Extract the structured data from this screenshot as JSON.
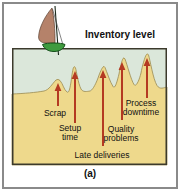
{
  "title": "Inventory level",
  "caption": "(a)",
  "problems": [
    {
      "id": "scrap",
      "label": "Scrap"
    },
    {
      "id": "setup-time",
      "label": "Setup time"
    },
    {
      "id": "late-deliveries",
      "label": "Late deliveries"
    },
    {
      "id": "quality-problems",
      "label": "Quality problems"
    },
    {
      "id": "process-downtime",
      "label": "Process downtime"
    }
  ],
  "icons": [
    {
      "name": "sailboat-icon",
      "meaning": "inventory floating on water level"
    },
    {
      "name": "up-arrow-icon",
      "meaning": "problem peak rising toward inventory surface"
    }
  ],
  "colors": {
    "background": "#ffffff",
    "water": "#dbe7da",
    "sand": "#eed98c",
    "sand_edge": "#9a8a50",
    "arrow": "#b43a22",
    "sail": "#b5826a",
    "sail_edge": "#5a4030",
    "hull": "#3f9b3f",
    "hull_edge": "#14501a",
    "frame_border": "#8a8a8a",
    "box_border": "#3c3a2c",
    "text": "#111111"
  }
}
